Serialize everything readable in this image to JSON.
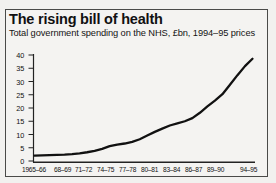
{
  "figure": {
    "title": "The rising bill of health",
    "subtitle": "Total government spending on the NHS, £bn, 1994–95 prices",
    "border_color": "#4a4a48",
    "background_color": "#f4f3f1",
    "line_color": "#111111"
  },
  "chart_data": {
    "type": "line",
    "title": "The rising bill of health",
    "subtitle": "Total government spending on the NHS, £bn, 1994–95 prices",
    "xlabel": "",
    "ylabel": "£bn, 1994–95 prices",
    "ylim": [
      0,
      40
    ],
    "yticks": [
      0,
      5,
      10,
      15,
      20,
      25,
      30,
      35,
      40
    ],
    "ytick_labels": [
      "0",
      "5",
      "10",
      "15",
      "20",
      "25",
      "30",
      "35",
      "40"
    ],
    "grid": false,
    "legend": "none",
    "xtick_labels": [
      "1965–66",
      "68–69",
      "71–72",
      "74–75",
      "77–78",
      "80–81",
      "83–84",
      "86–87",
      "89–90",
      "94–95"
    ],
    "categories": [
      "1965-66",
      "1966-67",
      "1967-68",
      "1968-69",
      "1969-70",
      "1970-71",
      "1971-72",
      "1972-73",
      "1973-74",
      "1974-75",
      "1975-76",
      "1976-77",
      "1977-78",
      "1978-79",
      "1979-80",
      "1980-81",
      "1981-82",
      "1982-83",
      "1983-84",
      "1984-85",
      "1985-86",
      "1986-87",
      "1987-88",
      "1988-89",
      "1989-90",
      "1990-91",
      "1991-92",
      "1992-93",
      "1993-94",
      "1994-95"
    ],
    "values": [
      2.0,
      2.1,
      2.2,
      2.3,
      2.4,
      2.6,
      2.9,
      3.3,
      3.8,
      4.6,
      5.6,
      6.2,
      6.6,
      7.2,
      8.2,
      9.6,
      11.0,
      12.2,
      13.4,
      14.2,
      15.0,
      16.2,
      18.2,
      20.6,
      22.8,
      25.2,
      28.8,
      32.4,
      35.8,
      38.6
    ],
    "series": [
      {
        "name": "Total government spending on the NHS",
        "values": [
          2.0,
          2.1,
          2.2,
          2.3,
          2.4,
          2.6,
          2.9,
          3.3,
          3.8,
          4.6,
          5.6,
          6.2,
          6.6,
          7.2,
          8.2,
          9.6,
          11.0,
          12.2,
          13.4,
          14.2,
          15.0,
          16.2,
          18.2,
          20.6,
          22.8,
          25.2,
          28.8,
          32.4,
          35.8,
          38.6
        ]
      }
    ]
  }
}
